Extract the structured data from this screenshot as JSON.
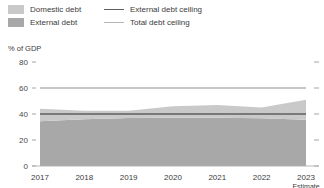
{
  "legend": {
    "items": [
      {
        "label": "Domestic debt",
        "kind": "swatch",
        "color": "#c9c9c9",
        "name": "legend-domestic-debt"
      },
      {
        "label": "External debt",
        "kind": "swatch",
        "color": "#a8a8a8",
        "name": "legend-external-debt"
      },
      {
        "label": "External debt ceiling",
        "kind": "line",
        "color": "#5e5e5e",
        "width": 1.6,
        "name": "legend-external-debt-ceiling"
      },
      {
        "label": "Total debt ceiling",
        "kind": "line",
        "color": "#b5b5b5",
        "width": 1.6,
        "name": "legend-total-debt-ceiling"
      }
    ]
  },
  "axis_title": "% of GDP",
  "x_note": "Estimate",
  "chart_data": {
    "type": "area",
    "title": "",
    "subtitle": "",
    "xlabel": "",
    "ylabel": "% of GDP",
    "ylim": [
      0,
      80
    ],
    "yticks": [
      0,
      20,
      40,
      60,
      80
    ],
    "ytick_labels": [
      "0",
      "20",
      "40",
      "60",
      "80"
    ],
    "grid": false,
    "legend_position": "top-left",
    "stacked": true,
    "categories": [
      "2017",
      "2018",
      "2019",
      "2020",
      "2021",
      "2022",
      "2023"
    ],
    "x": [
      2017,
      2018,
      2019,
      2020,
      2021,
      2022,
      2023
    ],
    "series": [
      {
        "name": "External debt",
        "color": "#a8a8a8",
        "values": [
          34.5,
          36.0,
          37.0,
          37.2,
          37.2,
          36.8,
          35.5
        ]
      },
      {
        "name": "Domestic debt",
        "color": "#c9c9c9",
        "values": [
          9.5,
          6.5,
          5.5,
          8.8,
          9.8,
          8.2,
          15.5
        ]
      }
    ],
    "totals": [
      44.0,
      42.5,
      42.5,
      46.0,
      47.0,
      45.0,
      51.0
    ],
    "reference_lines": [
      {
        "name": "External debt ceiling",
        "value": 40,
        "color": "#5e5e5e",
        "width": 1.6
      },
      {
        "name": "Total debt ceiling",
        "value": 60,
        "color": "#b5b5b5",
        "width": 1.6
      }
    ],
    "annotations": [
      {
        "text": "Estimate",
        "x": "2023",
        "position": "below-axis"
      }
    ]
  }
}
